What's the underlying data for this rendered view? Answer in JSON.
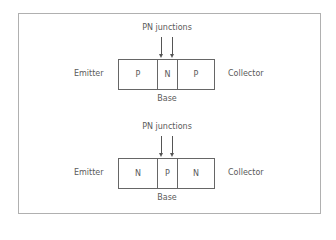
{
  "diagrams": [
    {
      "type": "PNP",
      "title": "PN junctions",
      "left_label": "Emitter",
      "right_label": "Collector",
      "bottom_label": "Base",
      "regions": [
        "P",
        "N",
        "P"
      ]
    },
    {
      "type": "NPN",
      "title": "PN junctions",
      "left_label": "Emitter",
      "right_label": "Collector",
      "bottom_label": "Base",
      "regions": [
        "N",
        "P",
        "N"
      ]
    }
  ],
  "colors": {
    "border": "#b0b0b0",
    "line": "#666666",
    "text": "#5a5a5a"
  }
}
